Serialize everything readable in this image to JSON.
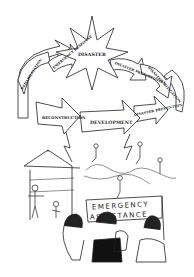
{
  "figure": {
    "center": "DISASTER",
    "cycle_labels": {
      "rehabilitation": "REHABILITATION",
      "emergency_response": "EMERGENCY RESPONSE",
      "preparedness": "DISASTER PREPAREDNESS",
      "mitigation": "DISASTER MITIGATION",
      "prevention": "DISASTER PREVENTION",
      "development": "DEVELOPMENT",
      "reconstruction": "RECONSTRUCTION"
    },
    "banner_line1": "EMERGENCY",
    "banner_line2": "ASSISTANCE",
    "colors": {
      "ink": "#222222",
      "paper": "#ffffff"
    }
  }
}
